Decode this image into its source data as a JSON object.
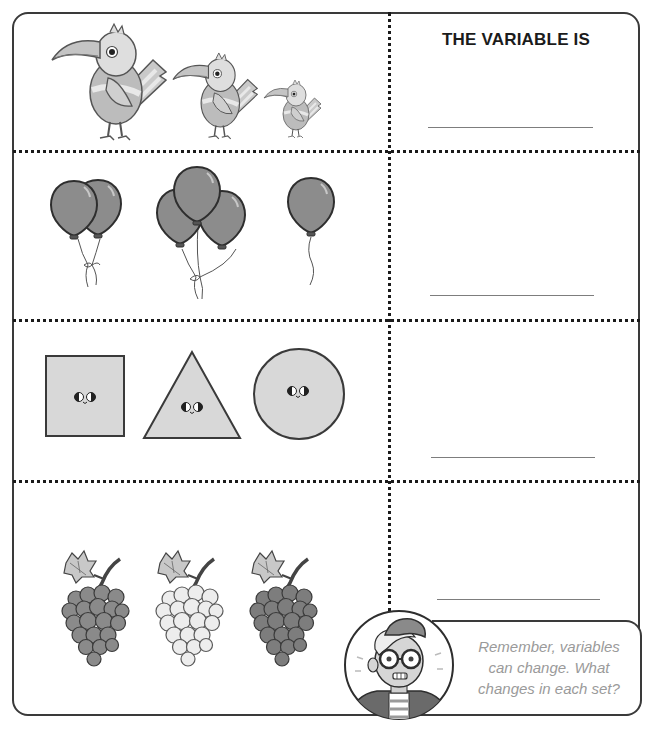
{
  "worksheet": {
    "header": {
      "title": "THE VARIABLE IS"
    },
    "rows": [
      {
        "id": "birds",
        "items": [
          {
            "name": "bird",
            "size": "large"
          },
          {
            "name": "bird",
            "size": "medium"
          },
          {
            "name": "bird",
            "size": "small"
          }
        ],
        "answer": ""
      },
      {
        "id": "balloons",
        "items": [
          {
            "name": "balloon-group",
            "count": 2
          },
          {
            "name": "balloon-group",
            "count": 3
          },
          {
            "name": "balloon-group",
            "count": 1
          }
        ],
        "answer": ""
      },
      {
        "id": "shapes",
        "items": [
          {
            "name": "square"
          },
          {
            "name": "triangle"
          },
          {
            "name": "circle"
          }
        ],
        "answer": ""
      },
      {
        "id": "grapes",
        "items": [
          {
            "name": "grape-bunch",
            "shade": "dark"
          },
          {
            "name": "grape-bunch",
            "shade": "light"
          },
          {
            "name": "grape-bunch",
            "shade": "dark"
          }
        ],
        "answer": ""
      }
    ],
    "tip": {
      "line1": "Remember, variables",
      "line2": "can change. What",
      "line3": "changes in each set?"
    },
    "colors": {
      "border": "#3a3a3a",
      "divider": "#1a1a1a",
      "tip_text": "#9a9a9a",
      "answer_line": "#7d7d7d"
    }
  }
}
